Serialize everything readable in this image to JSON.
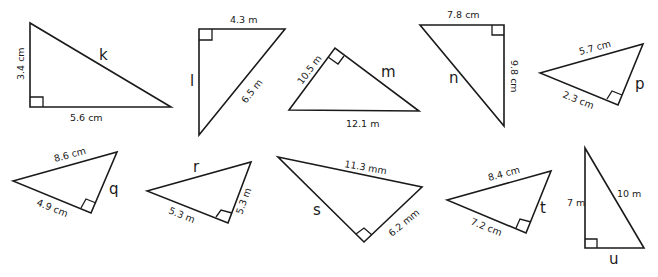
{
  "diagram": {
    "type": "right-triangle-worksheet",
    "triangles": [
      {
        "id": "k",
        "unknown": "k",
        "unknown_side": "hypotenuse",
        "sides": {
          "leg_vertical": "3.4 cm",
          "leg_horizontal": "5.6 cm"
        }
      },
      {
        "id": "l",
        "unknown": "l",
        "unknown_side": "leg",
        "sides": {
          "leg_top": "4.3 m",
          "hypotenuse": "6.5 m"
        }
      },
      {
        "id": "m",
        "unknown": "m",
        "unknown_side": "leg",
        "sides": {
          "leg": "10.5 m",
          "hypotenuse": "12.1 m"
        }
      },
      {
        "id": "n",
        "unknown": "n",
        "unknown_side": "hypotenuse",
        "sides": {
          "leg_top": "7.8 cm",
          "leg_vertical": "9.8 cm"
        }
      },
      {
        "id": "p",
        "unknown": "p",
        "unknown_side": "leg",
        "sides": {
          "hypotenuse": "5.7 cm",
          "leg": "2.3 cm"
        }
      },
      {
        "id": "q",
        "unknown": "q",
        "unknown_side": "leg",
        "sides": {
          "hypotenuse": "8.6 cm",
          "leg": "4.9 cm"
        }
      },
      {
        "id": "r",
        "unknown": "r",
        "unknown_side": "hypotenuse",
        "sides": {
          "leg_bottom": "5.3 m",
          "leg_right": "5.3 m"
        }
      },
      {
        "id": "s",
        "unknown": "s",
        "unknown_side": "leg",
        "sides": {
          "hypotenuse": "11.3 mm",
          "leg": "6.2 mm"
        }
      },
      {
        "id": "t",
        "unknown": "t",
        "unknown_side": "leg",
        "sides": {
          "hypotenuse": "8.4 cm",
          "leg": "7.2 cm"
        }
      },
      {
        "id": "u",
        "unknown": "u",
        "unknown_side": "leg",
        "sides": {
          "leg_vertical": "7 m",
          "hypotenuse": "10 m"
        }
      }
    ]
  },
  "labels": {
    "k": {
      "var": "k",
      "a": "3.4 cm",
      "b": "5.6 cm"
    },
    "l": {
      "var": "l",
      "a": "4.3 m",
      "b": "6.5 m"
    },
    "m": {
      "var": "m",
      "a": "10.5 m",
      "b": "12.1 m"
    },
    "n": {
      "var": "n",
      "a": "7.8 cm",
      "b": "9.8 cm"
    },
    "p": {
      "var": "p",
      "a": "5.7 cm",
      "b": "2.3 cm"
    },
    "q": {
      "var": "q",
      "a": "8.6 cm",
      "b": "4.9 cm"
    },
    "r": {
      "var": "r",
      "a": "5.3 m",
      "b": "5.3 m"
    },
    "s": {
      "var": "s",
      "a": "11.3 mm",
      "b": "6.2 mm"
    },
    "t": {
      "var": "t",
      "a": "8.4 cm",
      "b": "7.2 cm"
    },
    "u": {
      "var": "u",
      "a": "7 m",
      "b": "10 m"
    }
  }
}
